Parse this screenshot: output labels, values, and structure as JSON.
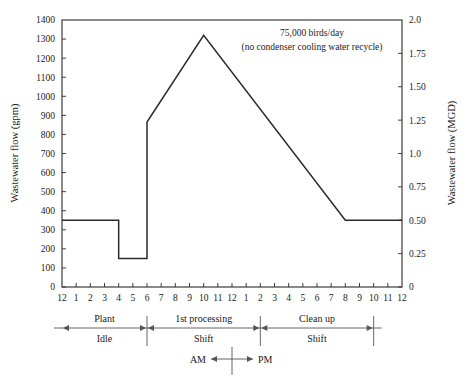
{
  "chart_data": {
    "type": "line",
    "title": "",
    "annotation": [
      "75,000 birds/day",
      "(no condenser cooling water recycle)"
    ],
    "xlabel": "",
    "ylabel": "Wastewater flow (gpm)",
    "ylabel_right": "Wastewater flow (MGD)",
    "xlim": [
      0,
      24
    ],
    "ylim": [
      0,
      1400
    ],
    "ylim_right": [
      0,
      2.0
    ],
    "grid": false,
    "legend": "none",
    "x_tick_labels": [
      "12",
      "1",
      "2",
      "3",
      "4",
      "5",
      "6",
      "7",
      "8",
      "9",
      "10",
      "11",
      "12",
      "1",
      "2",
      "3",
      "4",
      "5",
      "6",
      "7",
      "8",
      "9",
      "10",
      "11",
      "12"
    ],
    "y_tick_labels": [
      "0",
      "100",
      "200",
      "300",
      "400",
      "500",
      "600",
      "700",
      "800",
      "900",
      "1000",
      "1100",
      "1200",
      "1300",
      "1400"
    ],
    "y_tick_values": [
      0,
      100,
      200,
      300,
      400,
      500,
      600,
      700,
      800,
      900,
      1000,
      1100,
      1200,
      1300,
      1400
    ],
    "y_right_tick_labels": [
      "0",
      "0.25",
      "0.50",
      "0.75",
      "1.0",
      "1.25",
      "1.50",
      "1.75",
      "2.0"
    ],
    "y_right_tick_values": [
      0,
      0.25,
      0.5,
      0.75,
      1.0,
      1.25,
      1.5,
      1.75,
      2.0
    ],
    "series": [
      {
        "name": "Wastewater flow",
        "x": [
          0,
          4,
          4,
          6,
          6,
          10,
          20,
          24
        ],
        "values": [
          350,
          350,
          150,
          150,
          865,
          1320,
          350,
          350
        ],
        "hours_label": [
          "12 AM",
          "4 AM",
          "4 AM",
          "6 AM",
          "6 AM",
          "10 AM",
          "8 PM",
          "12 AM"
        ]
      }
    ]
  },
  "shift_bands": [
    {
      "name": "plant-idle",
      "line1": "Plant",
      "line2": "Idle",
      "start_hour": 0,
      "end_hour": 6
    },
    {
      "name": "first-processing-shift",
      "line1": "1st processing",
      "line2": "Shift",
      "start_hour": 6,
      "end_hour": 14
    },
    {
      "name": "clean-up-shift",
      "line1": "Clean up",
      "line2": "Shift",
      "start_hour": 14,
      "end_hour": 22
    }
  ],
  "ampm": {
    "left_label": "AM",
    "right_label": "PM",
    "divider_hour": 12
  },
  "colors": {
    "line": "#2b2b2b",
    "axis": "#2b2b2b",
    "text": "#1a1a1a",
    "rule": "#555555",
    "background": "#ffffff"
  }
}
